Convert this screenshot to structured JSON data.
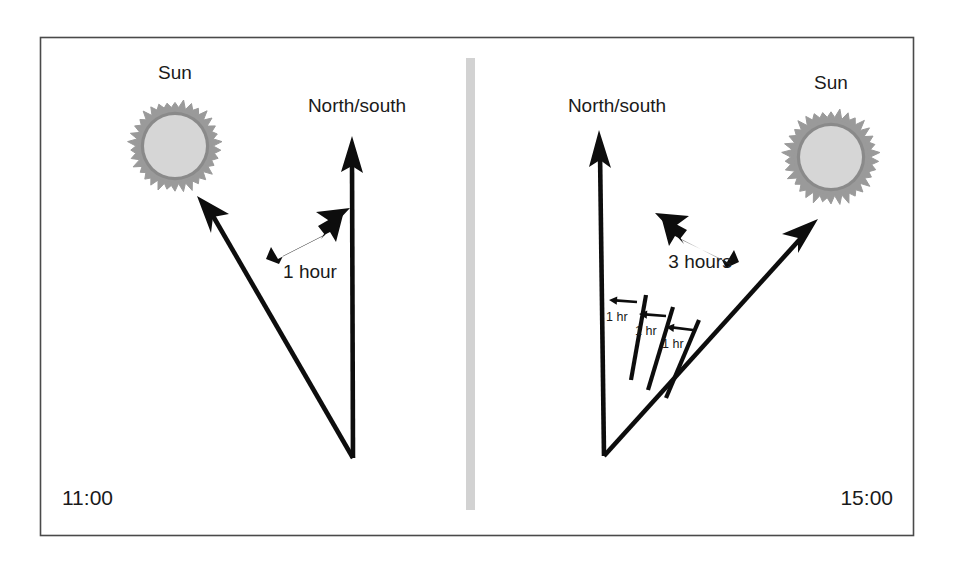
{
  "figure": {
    "frame": {
      "border_color": "#4a4a4a",
      "background": "#ffffff",
      "x": 40,
      "y": 37,
      "width": 873,
      "height": 498
    },
    "divider": {
      "name": "panel-divider",
      "color": "#d2d2d2",
      "x": 466,
      "y": 58,
      "width": 9,
      "height": 452
    },
    "ink_color": "#0d0d0d",
    "sun_disc_color": "#d6d6d6",
    "sun_ring_color": "#8a8a8a",
    "sun_ray_color": "#9a9a9a"
  },
  "panels": [
    {
      "id": "panel-left",
      "time_label": "11:00",
      "sun_label": "Sun",
      "axis_label": "North/south",
      "duration_label": "1 hour",
      "duration_arrow_direction": "up-right",
      "description": "At 11:00 the bearing to the sun lies to the left of the north/south line; the sun's apparent motion over 1 hour is to the right.",
      "vertex": {
        "x": 353,
        "y": 458
      },
      "axis_arrow_tip": {
        "x": 352,
        "y": 140
      },
      "sun_arrow_tip": {
        "x": 199,
        "y": 199
      },
      "sun": {
        "cx": 175,
        "cy": 146,
        "outer_radius": 48,
        "inner_radius": 31
      },
      "sun_label_pos": {
        "x": 175,
        "y": 79
      },
      "axis_label_pos": {
        "x": 357,
        "y": 112
      },
      "duration_label_pos": {
        "x": 310,
        "y": 278
      },
      "duration_arrow": {
        "x1": 268,
        "y1": 255,
        "x2": 344,
        "y2": 215
      },
      "time_label_pos": {
        "x": 62,
        "y": 505
      },
      "ticks": []
    },
    {
      "id": "panel-right",
      "time_label": "15:00",
      "sun_label": "Sun",
      "axis_label": "North/south",
      "duration_label": "3 hours",
      "duration_arrow_direction": "up-left",
      "description": "At 15:00 the bearing to the sun lies to the right of the north/south line; over the intervening 3 hours the bearing swept through three one-hour steps.",
      "vertex": {
        "x": 604,
        "y": 456
      },
      "axis_arrow_tip": {
        "x": 600,
        "y": 134
      },
      "sun_arrow_tip": {
        "x": 816,
        "y": 221
      },
      "sun": {
        "cx": 831,
        "cy": 157,
        "outer_radius": 50,
        "inner_radius": 31
      },
      "sun_label_pos": {
        "x": 831,
        "y": 89
      },
      "axis_label_pos": {
        "x": 617,
        "y": 112
      },
      "duration_label_pos": {
        "x": 700,
        "y": 268
      },
      "duration_arrow": {
        "x1": 737,
        "y1": 250,
        "x2": 661,
        "y2": 213
      },
      "ticks": [
        {
          "label": "1 hr",
          "line": {
            "x1": 631,
            "y1": 380,
            "x2": 646,
            "y2": 295
          },
          "arrow": {
            "x1": 637,
            "y1": 302,
            "x2": 609,
            "y2": 300
          },
          "label_pos": {
            "x": 606,
            "y": 321
          }
        },
        {
          "label": "1 hr",
          "line": {
            "x1": 648,
            "y1": 390,
            "x2": 673,
            "y2": 307
          },
          "arrow": {
            "x1": 666,
            "y1": 316,
            "x2": 639,
            "y2": 314
          },
          "label_pos": {
            "x": 635,
            "y": 335
          }
        },
        {
          "label": "1 hr",
          "line": {
            "x1": 666,
            "y1": 398,
            "x2": 699,
            "y2": 320
          },
          "arrow": {
            "x1": 693,
            "y1": 330,
            "x2": 666,
            "y2": 327
          },
          "label_pos": {
            "x": 662,
            "y": 348
          }
        }
      ]
    }
  ]
}
